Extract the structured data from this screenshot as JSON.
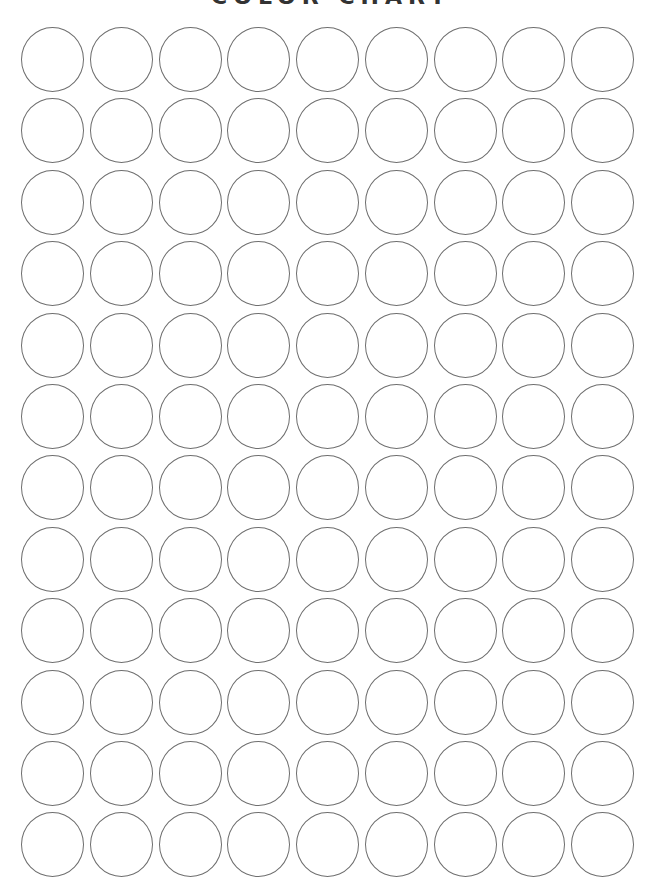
{
  "page": {
    "title": "COLOR CHART"
  },
  "grid": {
    "rows": 12,
    "columns": 9,
    "swatch_fill": "#ffffff",
    "swatch_stroke": "#6e6e6e",
    "origin_x": 21,
    "origin_y": 27,
    "pitch_x": 68.75,
    "pitch_y": 71.4
  }
}
